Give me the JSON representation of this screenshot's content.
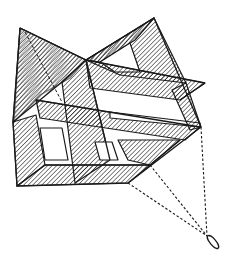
{
  "figure": {
    "background": "#ffffff",
    "ink": "#1a1a1a",
    "points": {
      "left_peak": [
        20,
        28
      ],
      "right_peak": [
        154,
        18
      ],
      "center_top": [
        86,
        60
      ],
      "right_wing_tip": [
        205,
        83
      ],
      "right_corner": [
        201,
        127
      ],
      "left_low": [
        13,
        122
      ],
      "bottom_left": [
        17,
        186
      ],
      "bottom_mid": [
        128,
        183
      ],
      "bridle_knot": [
        207,
        236
      ],
      "loop_end": [
        219,
        248
      ]
    }
  }
}
